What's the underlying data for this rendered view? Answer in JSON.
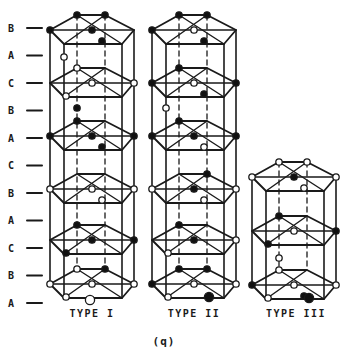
{
  "figure": {
    "caption": "(q)",
    "line_color": "#1a1a1a",
    "background_color": "#ffffff",
    "atom_fill_filled": "#111111",
    "atom_fill_open": "#ffffff",
    "stacking_labels": [
      {
        "label": "B"
      },
      {
        "label": "A"
      },
      {
        "label": "C"
      },
      {
        "label": "B"
      },
      {
        "label": "A"
      },
      {
        "label": "C"
      },
      {
        "label": "B"
      },
      {
        "label": "A"
      },
      {
        "label": "C"
      },
      {
        "label": "B"
      },
      {
        "label": "A"
      }
    ],
    "columns": [
      {
        "name": "TYPE I",
        "layers": [
          {
            "y": 30,
            "level": "B",
            "atoms": {
              "L": "filled",
              "TL": "filled",
              "TR": "filled",
              "C": "filled",
              "BR": "filled"
            }
          },
          {
            "y": 83,
            "level": "C",
            "atoms": {
              "TL": "open",
              "C": "open",
              "R": "open",
              "BL": "open"
            }
          },
          {
            "y": 136,
            "level": "A",
            "atoms": {
              "L": "filled",
              "TL": "filled",
              "C": "filled",
              "R": "filled",
              "BR": "filled"
            }
          },
          {
            "y": 189,
            "level": "B",
            "atoms": {
              "L": "open",
              "C": "open",
              "R": "open",
              "BR": "open"
            }
          },
          {
            "y": 240,
            "level": "C",
            "atoms": {
              "TL": "filled",
              "C": "filled",
              "R": "filled",
              "BL": "filled"
            }
          },
          {
            "y": 284,
            "level": "A",
            "atoms": {
              "L": "open",
              "TL": "open",
              "TR": "filled",
              "C": "open",
              "R": "open",
              "BL": "open",
              "FB": "open"
            }
          }
        ],
        "gap_atoms": [
          {
            "y": 57,
            "x_site": "BL",
            "fill": "open"
          },
          {
            "y": 108,
            "x_site": "TL",
            "fill": "filled"
          }
        ]
      },
      {
        "name": "TYPE II",
        "layers": [
          {
            "y": 30,
            "level": "B",
            "atoms": {
              "L": "filled",
              "TL": "filled",
              "TR": "filled",
              "C": "open",
              "BR": "filled"
            }
          },
          {
            "y": 83,
            "level": "C",
            "atoms": {
              "L": "filled",
              "TL": "filled",
              "C": "open",
              "R": "filled",
              "BR": "filled"
            }
          },
          {
            "y": 136,
            "level": "A",
            "atoms": {
              "L": "filled",
              "TL": "filled",
              "C": "filled",
              "R": "filled",
              "BR": "open"
            }
          },
          {
            "y": 189,
            "level": "B",
            "atoms": {
              "L": "open",
              "TR": "filled",
              "C": "filled",
              "R": "open",
              "BR": "open"
            }
          },
          {
            "y": 240,
            "level": "C",
            "atoms": {
              "TL": "filled",
              "C": "filled",
              "R": "open",
              "BL": "open"
            }
          },
          {
            "y": 284,
            "level": "A",
            "atoms": {
              "L": "filled",
              "TL": "filled",
              "TR": "filled",
              "C": "open",
              "R": "open",
              "BL": "open",
              "FBR": "filled"
            }
          }
        ],
        "gap_atoms": [
          {
            "y": 108,
            "x_site": "BL",
            "fill": "open"
          }
        ]
      },
      {
        "name": "TYPE III",
        "layers": [
          {
            "y": 177,
            "level": "",
            "atoms": {
              "L": "open",
              "TL": "open",
              "TR": "open",
              "C": "filled",
              "R": "open",
              "BR": "open"
            }
          },
          {
            "y": 231,
            "level": "",
            "atoms": {
              "TL": "filled",
              "C": "open",
              "R": "filled",
              "BL": "filled"
            }
          },
          {
            "y": 285,
            "level": "",
            "atoms": {
              "L": "filled",
              "TL": "open",
              "C": "open",
              "R": "open",
              "BL": "open",
              "BR": "filled",
              "FBR": "filled"
            }
          }
        ],
        "gap_atoms": [
          {
            "y": 258,
            "x_site": "TL",
            "fill": "open"
          }
        ]
      }
    ]
  }
}
